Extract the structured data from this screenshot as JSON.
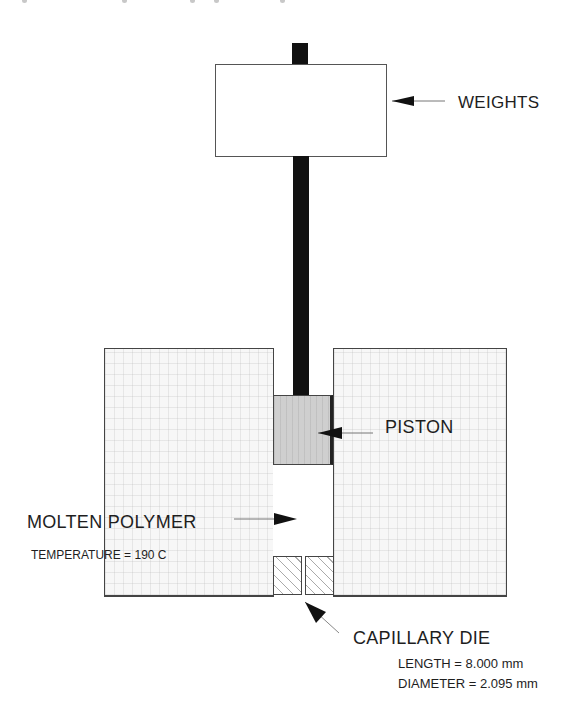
{
  "diagram": {
    "type": "capillary rheometer schematic",
    "components": {
      "weights": {
        "label": "WEIGHTS"
      },
      "piston": {
        "label": "PISTON"
      },
      "molten_polymer": {
        "label": "MOLTEN POLYMER",
        "detail": "TEMPERATURE = 190 C"
      },
      "capillary_die": {
        "label": "CAPILLARY DIE",
        "length": "LENGTH = 8.000 mm",
        "diameter": "DIAMETER = 2.095 mm"
      }
    },
    "colors": {
      "rod": "#111111",
      "piston_fill": "#cfcfcf",
      "block_fill": "#f7f7f7",
      "line": "#444444",
      "text": "#1e1e1e"
    }
  }
}
